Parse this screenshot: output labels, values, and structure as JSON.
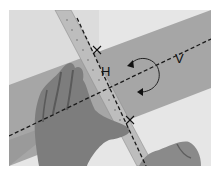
{
  "image": {
    "description": "Grayscale photo of hands holding a ruler across a diagonal strip of paper, with dashed reference lines and a rotation arrow",
    "labels": {
      "h": "H",
      "v": "V"
    },
    "colors": {
      "background": "#e9e9e9",
      "paper_strip": "#a9a9a9",
      "ruler": "#b8b8b8",
      "hand": "#7a7a7a",
      "dash_line": "#1a1a1a"
    }
  }
}
